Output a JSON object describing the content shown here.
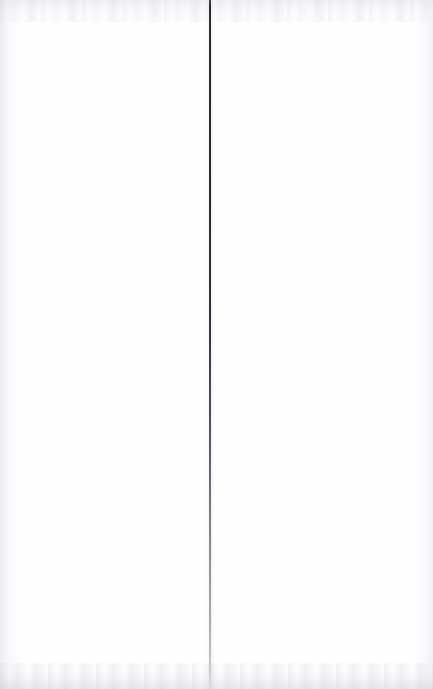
{
  "document": {
    "kind": "scanned-page",
    "page_label": "",
    "body_text": "",
    "has_visible_text": false,
    "notes": ""
  },
  "canvas": {
    "width_px": 433,
    "height_px": 689,
    "background_color": "#ffffff",
    "paper_color": "#fefeff"
  },
  "gutter": {
    "name": "page-fold-crease",
    "orientation": "vertical",
    "x_px": 209,
    "thickness_px": 2,
    "top_y_px": 0,
    "bottom_y_px": 689,
    "color_dark": "#272730",
    "color_mid": "#53535e",
    "color_faded": "#c9c9cf",
    "fades_toward": "bottom"
  },
  "artifacts": {
    "top_noise_band": {
      "name": "scan-noise-top",
      "height_px": 22,
      "color": "#ccccd3"
    },
    "bottom_noise_band": {
      "name": "scan-noise-bottom",
      "height_px": 26,
      "color": "#bebec7"
    },
    "left_edge_shade": {
      "name": "left-margin-shade",
      "width_px": 26,
      "color": "#c4c4ca"
    },
    "right_edge_shade": {
      "name": "right-margin-shade",
      "width_px": 24,
      "color": "#c8c8ce"
    }
  }
}
